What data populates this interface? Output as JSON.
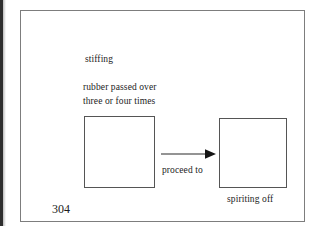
{
  "page": {
    "page_number": "304",
    "width": 320,
    "height": 234,
    "background_color": "#ffffff",
    "frame_color": "#7d7d7d",
    "ink_color": "#1c1c1c"
  },
  "figure": {
    "annotations": {
      "top_note": "stiffing",
      "process_note_line1": "rubber passed over",
      "process_note_line2": "three or four times"
    },
    "nodes": [
      {
        "id": "source-box",
        "label": "",
        "caption": "",
        "border_color": "#555555"
      },
      {
        "id": "target-box",
        "label": "",
        "caption": "spiriting off",
        "border_color": "#555555"
      }
    ],
    "connector": {
      "id": "proceed-arrow",
      "label": "proceed to",
      "direction": "left-to-right",
      "style": "solid-line-with-filled-arrowhead",
      "color": "#2a2a2a"
    }
  }
}
